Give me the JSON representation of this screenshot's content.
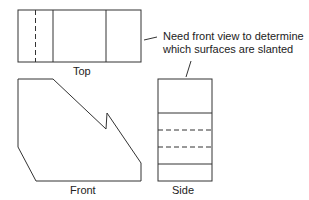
{
  "labels": {
    "top": "Top",
    "front": "Front",
    "side": "Side"
  },
  "note": {
    "line1": "Need front view to determine",
    "line2": "which surfaces are slanted"
  },
  "colors": {
    "line": "#333333",
    "background": "#ffffff"
  }
}
